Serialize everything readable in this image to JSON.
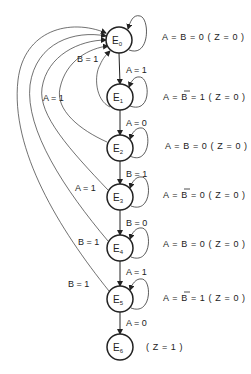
{
  "diagram": {
    "type": "state-machine",
    "states": [
      {
        "id": "E0",
        "letter": "E",
        "sub": "0",
        "cx": 119,
        "cy": 40,
        "output": {
          "prefix": "A = ",
          "var": "B",
          "negated": false,
          "suffix": " = 0 ( Z = 0 )"
        }
      },
      {
        "id": "E1",
        "letter": "E",
        "sub": "1",
        "cx": 120,
        "cy": 97,
        "output": {
          "prefix": "A = ",
          "var": "B",
          "negated": true,
          "suffix": " = 1 ( Z = 0 )"
        }
      },
      {
        "id": "E2",
        "letter": "E",
        "sub": "2",
        "cx": 120,
        "cy": 148,
        "output": {
          "prefix": "A = ",
          "var": "B",
          "negated": false,
          "suffix": " = 0 ( Z = 0 )"
        }
      },
      {
        "id": "E3",
        "letter": "E",
        "sub": "3",
        "cx": 120,
        "cy": 197,
        "output": {
          "prefix": "A = ",
          "var": "B",
          "negated": true,
          "suffix": " = 0 ( Z = 0 )"
        }
      },
      {
        "id": "E4",
        "letter": "E",
        "sub": "4",
        "cx": 120,
        "cy": 248,
        "output": {
          "prefix": "A = ",
          "var": "B",
          "negated": false,
          "suffix": " = 0 ( Z = 0 )"
        }
      },
      {
        "id": "E5",
        "letter": "E",
        "sub": "5",
        "cx": 120,
        "cy": 299,
        "output": {
          "prefix": "A = ",
          "var": "B",
          "negated": true,
          "suffix": " = 1 ( Z = 0 )"
        }
      },
      {
        "id": "E6",
        "letter": "E",
        "sub": "6",
        "cx": 120,
        "cy": 347,
        "output": {
          "prefix": "",
          "var": "",
          "negated": false,
          "suffix": "( Z = 1 )"
        }
      }
    ],
    "forward_transitions": [
      {
        "from": "E0",
        "to": "E1",
        "label": "A = 1"
      },
      {
        "from": "E1",
        "to": "E2",
        "label": "A = 0"
      },
      {
        "from": "E2",
        "to": "E3",
        "label": "B = 1"
      },
      {
        "from": "E3",
        "to": "E4",
        "label": "B = 0"
      },
      {
        "from": "E4",
        "to": "E5",
        "label": "A = 1"
      },
      {
        "from": "E5",
        "to": "E6",
        "label": "A = 0"
      }
    ],
    "return_transitions": [
      {
        "from": "E1",
        "to": "E0",
        "label": "B = 1"
      },
      {
        "from": "E2",
        "to": "E0",
        "label": "A = 1"
      },
      {
        "from": "E3",
        "to": "E0",
        "label": "A = 1"
      },
      {
        "from": "E4",
        "to": "E0",
        "label": "B = 1"
      },
      {
        "from": "E5",
        "to": "E0",
        "label": "B = 1"
      }
    ],
    "self_loops": [
      "E0",
      "E1",
      "E2",
      "E3",
      "E4",
      "E5"
    ]
  }
}
